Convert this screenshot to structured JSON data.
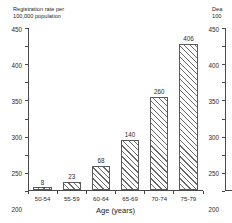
{
  "figure": {
    "background_color": "#ffffff",
    "bar_edge_color": "#5a5a5a",
    "hatch_color": "#6a6a6a",
    "axis_color": "#4a4a4a"
  },
  "chart_data": [
    {
      "type": "bar",
      "title": "Registration rate per\n100,000 population",
      "ylabel": "Registration rate per 100,000 population",
      "xlabel": "Age (years)",
      "categories": [
        "50-54",
        "55-59",
        "60-64",
        "65-69",
        "70-74",
        "75-79"
      ],
      "values": [
        8,
        23,
        68,
        140,
        260,
        406
      ],
      "value_labels": [
        "8",
        "23",
        "68",
        "140",
        "260",
        "406"
      ],
      "yticks": [
        0,
        50,
        100,
        150,
        200,
        250,
        300,
        350,
        400,
        450
      ],
      "ytick_labels": [
        "0",
        "50",
        "100",
        "150",
        "200",
        "250",
        "300",
        "350",
        "400",
        "450"
      ],
      "ylim": [
        0,
        450
      ],
      "grid": false,
      "legend": "none",
      "hatch": "diagonal"
    },
    {
      "type": "bar",
      "title": "Dea\n100",
      "ylabel": "Death rate per 100,000 population (clipped)",
      "xlabel": "",
      "categories": [],
      "values": [
        406
      ],
      "value_labels": [],
      "yticks": [
        0,
        50,
        100,
        150,
        200,
        250,
        300,
        350,
        400,
        450
      ],
      "ytick_labels": [
        "0",
        "50",
        "100",
        "150",
        "200",
        "250",
        "300",
        "350",
        "400",
        "450"
      ],
      "ylim": [
        0,
        450
      ],
      "grid": false,
      "legend": "none",
      "hatch": "diagonal",
      "clipped": true
    }
  ]
}
